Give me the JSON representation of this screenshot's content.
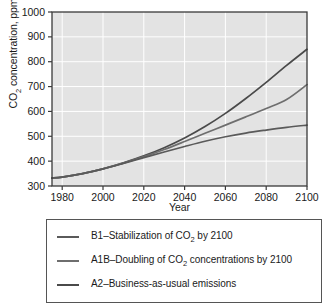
{
  "chart_data": {
    "type": "line",
    "title": "",
    "xlabel": "Year",
    "ylabel": "CO2 concentration, ppm",
    "ylabel_parts": {
      "pre": "CO",
      "sub": "2",
      "post": " concentration, ppm"
    },
    "xlim": [
      1975,
      2100
    ],
    "ylim": [
      300,
      1000
    ],
    "xticks": [
      1980,
      2000,
      2020,
      2040,
      2060,
      2080,
      2100
    ],
    "yticks": [
      300,
      400,
      500,
      600,
      700,
      800,
      900,
      1000
    ],
    "grid": true,
    "grid_color": "#ffffff",
    "plot_background": "#e3e3e3",
    "legend_position": "below-plot",
    "x": [
      1975,
      1980,
      1990,
      2000,
      2010,
      2020,
      2030,
      2040,
      2050,
      2060,
      2070,
      2080,
      2090,
      2100
    ],
    "series": [
      {
        "name": "A2-Business-as-usual emissions",
        "label": "A2–Business-as-usual emissions",
        "color": "#4a4a4a",
        "values": [
          332,
          336,
          350,
          369,
          393,
          421,
          454,
          493,
          539,
          592,
          652,
          717,
          785,
          850
        ]
      },
      {
        "name": "A1B-Doubling of CO2 concentrations by 2100",
        "label": "A1B–Doubling of CO2 concentrations by 2100",
        "label_parts": {
          "pre": "A1B–Doubling of CO",
          "sub": "2",
          "post": " concentrations by 2100"
        },
        "color": "#6e6e6e",
        "values": [
          332,
          336,
          350,
          369,
          392,
          418,
          447,
          479,
          512,
          545,
          578,
          612,
          648,
          708
        ]
      },
      {
        "name": "B1-Stabilization of CO2 by 2100",
        "label": "B1–Stabilization of CO2 by 2100",
        "label_parts": {
          "pre": "B1–Stabilization of CO",
          "sub": "2",
          "post": " by 2100"
        },
        "color": "#5a5a5a",
        "values": [
          332,
          336,
          350,
          369,
          391,
          414,
          437,
          459,
          480,
          498,
          513,
          525,
          536,
          545
        ]
      }
    ]
  },
  "legend": {
    "entries": [
      {
        "label_pre": "B1–Stabilization of CO",
        "label_sub": "2",
        "label_post": " by 2100",
        "color": "#5a5a5a"
      },
      {
        "label_pre": "A1B–Doubling of CO",
        "label_sub": "2",
        "label_post": " concentrations by 2100",
        "color": "#6e6e6e"
      },
      {
        "label_pre": "A2–Business-as-usual emissions",
        "label_sub": "",
        "label_post": "",
        "color": "#4a4a4a"
      }
    ]
  }
}
